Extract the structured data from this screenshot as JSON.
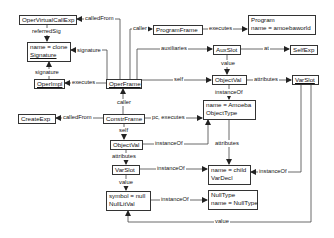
{
  "diagram": {
    "type": "object-diagram",
    "nodes": {
      "operVirtualCallExp": {
        "lines": [
          "OperVirtualCallExp"
        ]
      },
      "signature": {
        "lines": [
          "name = clone",
          "Signature"
        ]
      },
      "operImpl": {
        "lines": [
          "OperImpl"
        ]
      },
      "operFrame": {
        "lines": [
          "OperFrame"
        ]
      },
      "programFrame": {
        "lines": [
          "ProgramFrame"
        ]
      },
      "program": {
        "lines": [
          "Program",
          "name = amoebaworld"
        ]
      },
      "auxSlot": {
        "lines": [
          "AuxSlot"
        ]
      },
      "selfExp": {
        "lines": [
          "SelfExp"
        ]
      },
      "objectValTop": {
        "lines": [
          "ObjectVal"
        ]
      },
      "varSlotTop": {
        "lines": [
          "VarSlot"
        ]
      },
      "objectType": {
        "lines": [
          "name = Amoeba",
          "ObjectType"
        ]
      },
      "createExp": {
        "lines": [
          "CreateExp"
        ]
      },
      "constrFrame": {
        "lines": [
          "ConstrFrame"
        ]
      },
      "objectValMid": {
        "lines": [
          "ObjectVal"
        ]
      },
      "varSlotMid": {
        "lines": [
          "VarSlot"
        ]
      },
      "varDecl": {
        "lines": [
          "name = child",
          "VarDecl"
        ]
      },
      "nullLitVal": {
        "lines": [
          "symbol = null",
          "NullLitVal"
        ]
      },
      "nullType": {
        "lines": [
          "NullType",
          "name = NullType"
        ]
      }
    },
    "edges": [
      {
        "from": "operFrame",
        "to": "operVirtualCallExp",
        "label": "calledFrom"
      },
      {
        "from": "operVirtualCallExp",
        "to": "signature",
        "label": "referredSig"
      },
      {
        "from": "operFrame",
        "to": "signature",
        "label": "signature"
      },
      {
        "from": "operImpl",
        "to": "signature",
        "label": "signature"
      },
      {
        "from": "operFrame",
        "to": "operImpl",
        "label": "executes"
      },
      {
        "from": "operFrame",
        "to": "programFrame",
        "label": "caller"
      },
      {
        "from": "programFrame",
        "to": "program",
        "label": "executes"
      },
      {
        "from": "operFrame",
        "to": "auxSlot",
        "label": "auxiliaries"
      },
      {
        "from": "auxSlot",
        "to": "selfExp",
        "label": "at"
      },
      {
        "from": "auxSlot",
        "to": "objectValTop",
        "label": "value"
      },
      {
        "from": "operFrame",
        "to": "objectValTop",
        "label": "self"
      },
      {
        "from": "objectValTop",
        "to": "varSlotTop",
        "label": "attributes"
      },
      {
        "from": "objectValTop",
        "to": "objectType",
        "label": "instanceOf"
      },
      {
        "from": "constrFrame",
        "to": "operFrame",
        "label": "caller"
      },
      {
        "from": "constrFrame",
        "to": "createExp",
        "label": "calledFrom"
      },
      {
        "from": "constrFrame",
        "to": "objectType",
        "label": "pc, executes"
      },
      {
        "from": "constrFrame",
        "to": "objectValMid",
        "label": "self"
      },
      {
        "from": "objectValMid",
        "to": "objectType",
        "label": "instanceOf"
      },
      {
        "from": "objectType",
        "to": "varDecl",
        "label": "attributes"
      },
      {
        "from": "objectValMid",
        "to": "varSlotMid",
        "label": "attributes"
      },
      {
        "from": "varSlotMid",
        "to": "varDecl",
        "label": "instanceOf"
      },
      {
        "from": "varSlotTop",
        "to": "varDecl",
        "label": "instanceOf"
      },
      {
        "from": "varSlotMid",
        "to": "nullLitVal",
        "label": "value"
      },
      {
        "from": "nullLitVal",
        "to": "nullType",
        "label": "instanceOf"
      },
      {
        "from": "varSlotTop",
        "to": "nullLitVal",
        "label": "value"
      }
    ],
    "labels": {
      "calledFrom1": "calledFrom",
      "referredSig": "referredSig",
      "signature1": "signature",
      "signature2": "signature",
      "executes1": "executes",
      "caller1": "caller",
      "executes2": "executes",
      "auxiliaries": "auxiliaries",
      "at": "at",
      "value1": "value",
      "self1": "self",
      "attributes1": "attributes",
      "instanceOf1": "instanceOf",
      "caller2": "caller",
      "calledFrom2": "calledFrom",
      "pcExecutes": "pc, executes",
      "self2": "self",
      "instanceOf2": "instanceOf",
      "attributes2": "attributes",
      "attributes3": "attributes",
      "instanceOf3": "instanceOf",
      "instanceOf4": "instanceOf",
      "value2": "value",
      "instanceOf5": "instanceOf",
      "value3": "value"
    }
  }
}
